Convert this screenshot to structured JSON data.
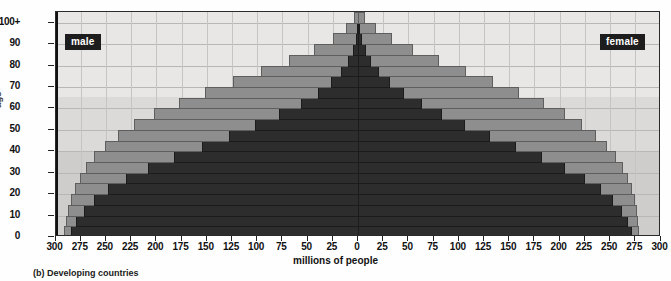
{
  "figure": {
    "caption": "(b) Developing countries",
    "xlabel": "millions of people",
    "ylabel": "age"
  },
  "legend": {
    "male_label": "male",
    "female_label": "female"
  },
  "colors": {
    "outer_bar": "#8e8e8e",
    "inner_bar": "#2d2d2d",
    "plot_background": "#eceae8",
    "axis": "#111111"
  },
  "chart_data": {
    "type": "bar",
    "title": "(b) Developing countries",
    "xlabel": "millions of people",
    "ylabel": "age",
    "orientation": "population-pyramid",
    "grid": true,
    "legend_position": "inside-top-corners",
    "xlim": [
      -300,
      300
    ],
    "xticks": [
      "300",
      "275",
      "250",
      "225",
      "200",
      "175",
      "150",
      "125",
      "100",
      "75",
      "50",
      "25",
      "0",
      "25",
      "50",
      "75",
      "100",
      "125",
      "150",
      "175",
      "200",
      "225",
      "250",
      "275",
      "300"
    ],
    "xtick_values": [
      -300,
      -275,
      -250,
      -225,
      -200,
      -175,
      -150,
      -125,
      -100,
      -75,
      -50,
      -25,
      0,
      25,
      50,
      75,
      100,
      125,
      150,
      175,
      200,
      225,
      250,
      275,
      300
    ],
    "ylim": [
      0,
      105
    ],
    "yticks": [
      "0",
      "10",
      "20",
      "30",
      "40",
      "50",
      "60",
      "70",
      "80",
      "90",
      "100+"
    ],
    "ytick_values": [
      0,
      10,
      20,
      30,
      40,
      50,
      60,
      70,
      80,
      90,
      100
    ],
    "age_groups": [
      "0-4",
      "5-9",
      "10-14",
      "15-19",
      "20-24",
      "25-29",
      "30-34",
      "35-39",
      "40-44",
      "45-49",
      "50-54",
      "55-59",
      "60-64",
      "65-69",
      "70-74",
      "75-79",
      "80-84",
      "85-89",
      "90-94",
      "95-99",
      "100+"
    ],
    "series": [
      {
        "name": "male-projected",
        "side": "left",
        "layer": "outer",
        "values": [
          292,
          290,
          288,
          285,
          281,
          276,
          270,
          262,
          251,
          238,
          222,
          202,
          178,
          152,
          124,
          96,
          68,
          44,
          25,
          12,
          4
        ]
      },
      {
        "name": "male-current",
        "side": "left",
        "layer": "inner",
        "values": [
          285,
          280,
          272,
          262,
          248,
          230,
          208,
          182,
          155,
          128,
          102,
          78,
          57,
          40,
          27,
          17,
          10,
          5,
          2,
          1,
          0
        ]
      },
      {
        "name": "female-projected",
        "side": "right",
        "layer": "outer",
        "values": [
          278,
          277,
          276,
          274,
          271,
          267,
          262,
          255,
          246,
          235,
          221,
          204,
          183,
          159,
          133,
          106,
          79,
          54,
          33,
          17,
          6
        ]
      },
      {
        "name": "female-current",
        "side": "right",
        "layer": "inner",
        "values": [
          271,
          267,
          261,
          252,
          240,
          224,
          204,
          181,
          156,
          130,
          105,
          82,
          62,
          45,
          31,
          20,
          12,
          7,
          3,
          1,
          0
        ]
      }
    ]
  }
}
